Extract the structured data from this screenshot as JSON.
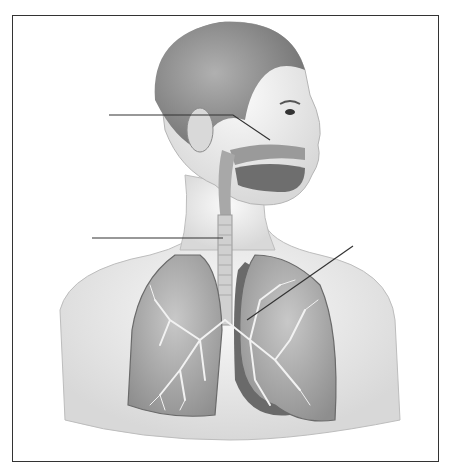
{
  "diagram": {
    "style": "grayscale pencil illustration",
    "frame": {
      "x": 12,
      "y": 15,
      "width": 427,
      "height": 447,
      "border_color": "#333333"
    },
    "labels": [
      {
        "id": "label-1",
        "text": "",
        "points_to": "nasal cavity",
        "line": [
          [
            109,
            115
          ],
          [
            233,
            115
          ],
          [
            270,
            140
          ]
        ]
      },
      {
        "id": "label-2",
        "text": "",
        "points_to": "trachea",
        "line": [
          [
            92,
            238
          ],
          [
            223,
            238
          ]
        ]
      },
      {
        "id": "label-3",
        "text": "",
        "points_to": "bronchi / lung",
        "line": [
          [
            353,
            246
          ],
          [
            247,
            320
          ]
        ]
      }
    ],
    "structures": [
      "head",
      "ear",
      "nasal cavity",
      "mouth",
      "pharynx",
      "trachea",
      "left lung",
      "right lung",
      "bronchial tree",
      "heart",
      "diaphragm"
    ],
    "colors": {
      "line": "#333333",
      "skin": "#e6e6e6",
      "hair": "#8c8c8c",
      "lung": "#b5b5b5",
      "dark": "#5a5a5a"
    }
  }
}
